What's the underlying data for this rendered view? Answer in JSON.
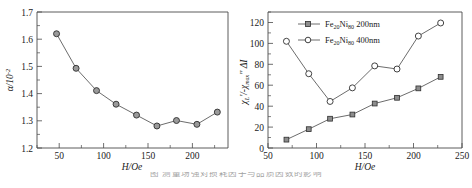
{
  "figure": {
    "caption_partial": "图 测量场强对损耗因子与品质因数的影响"
  },
  "chart_data": [
    {
      "id": "left-panel",
      "type": "line",
      "title": "",
      "xlabel": "H/Oe",
      "ylabel": "α/10⁻²",
      "xlim": [
        25,
        240
      ],
      "ylim": [
        1.2,
        1.7
      ],
      "xticks": [
        50,
        100,
        150,
        200
      ],
      "yticks": [
        "1.2",
        "1.3",
        "1.4",
        "1.5",
        "1.6",
        "1.7"
      ],
      "grid": false,
      "legend": null,
      "marker": "filled-circle",
      "x": [
        47,
        69,
        92,
        114,
        137,
        160,
        182,
        205,
        228
      ],
      "values": [
        1.62,
        1.493,
        1.411,
        1.361,
        1.321,
        1.281,
        1.301,
        1.287,
        1.332
      ]
    },
    {
      "id": "right-panel",
      "type": "line",
      "title": "",
      "xlabel": "H/Oe",
      "ylabel": "χₗ'/-χₘₐₓ'' ΔI",
      "xlim": [
        50,
        250
      ],
      "ylim": [
        0,
        130
      ],
      "xticks": [
        50,
        100,
        150,
        200,
        250
      ],
      "yticks": [
        "0",
        "20",
        "40",
        "60",
        "80",
        "100",
        "120"
      ],
      "grid": false,
      "legend_position": "top-left-inside",
      "x": [
        69,
        92,
        114,
        137,
        160,
        183,
        205,
        228
      ],
      "series": [
        {
          "name": "Fe₂₀Ni₈₀ 200nm",
          "marker": "filled-square",
          "values": [
            8,
            18,
            28,
            32,
            42.5,
            48,
            57,
            68
          ]
        },
        {
          "name": "Fe₂₀Ni₈₀ 400nm",
          "marker": "open-circle",
          "values": [
            102,
            71,
            44.5,
            57.5,
            78.5,
            75.5,
            107,
            119.5
          ]
        }
      ]
    }
  ],
  "left": {
    "xlabel": "H/Oe",
    "ylabel_main": "α/10",
    "ylabel_exp": "-2",
    "xticks": [
      "50",
      "100",
      "150",
      "200"
    ],
    "yticks": [
      "1.7",
      "1.6",
      "1.5",
      "1.4",
      "1.3",
      "1.2"
    ]
  },
  "right": {
    "xlabel": "H/Oe",
    "ylabel_chi_l": "χ",
    "ylabel_sub_l": "L",
    "ylabel_prime": "'",
    "ylabel_mid": "/-",
    "ylabel_chi_max": "χ",
    "ylabel_sub_max": "max",
    "ylabel_dprime": "''",
    "ylabel_delta": "ΔI",
    "xticks": [
      "50",
      "100",
      "150",
      "200",
      "250"
    ],
    "yticks": [
      "120",
      "100",
      "80",
      "60",
      "40",
      "20",
      "0"
    ],
    "legend": [
      {
        "label_prefix": "Fe",
        "label_sub1": "20",
        "label_mid": "Ni",
        "label_sub2": "80",
        "label_suffix": " 200nm"
      },
      {
        "label_prefix": "Fe",
        "label_sub1": "20",
        "label_mid": "Ni",
        "label_sub2": "80",
        "label_suffix": " 400nm"
      }
    ]
  },
  "colors": {
    "axis": "#4a4a4a",
    "line": "#5b5b5b",
    "marker_fill": "#9a9a9a",
    "marker_stroke": "#2e2e2e",
    "background": "#ffffff"
  }
}
